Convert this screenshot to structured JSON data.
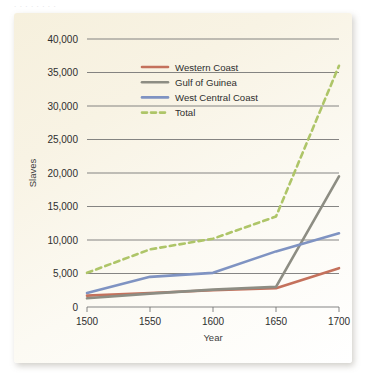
{
  "caption_remnant": "   .  .      .        .        .     .    .    .  ",
  "chart_data": {
    "type": "line",
    "title": "",
    "xlabel": "Year",
    "ylabel": "Slaves",
    "x": [
      1500,
      1550,
      1600,
      1650,
      1700
    ],
    "xlim": [
      1500,
      1700
    ],
    "ylim": [
      0,
      40000
    ],
    "xticks": [
      "1500",
      "1550",
      "1600",
      "1650",
      "1700"
    ],
    "yticks": [
      "0",
      "5,000",
      "10,000",
      "15,000",
      "20,000",
      "25,000",
      "30,000",
      "35,000",
      "40,000"
    ],
    "ytick_values": [
      0,
      5000,
      10000,
      15000,
      20000,
      25000,
      30000,
      35000,
      40000
    ],
    "grid": "horizontal",
    "legend_position": "upper-center-left",
    "series": [
      {
        "name": "Western Coast",
        "color": "#c4715c",
        "style": "solid",
        "values": [
          1700,
          2100,
          2500,
          2800,
          5800
        ]
      },
      {
        "name": "Gulf of Guinea",
        "color": "#8d8d83",
        "style": "solid",
        "values": [
          1300,
          2000,
          2600,
          3000,
          19500
        ]
      },
      {
        "name": "West Central Coast",
        "color": "#7f93c2",
        "style": "solid",
        "values": [
          2100,
          4500,
          5100,
          8300,
          11000
        ]
      },
      {
        "name": "Total",
        "color": "#aec568",
        "style": "dashed",
        "values": [
          5100,
          8600,
          10200,
          13500,
          36000
        ]
      }
    ]
  }
}
